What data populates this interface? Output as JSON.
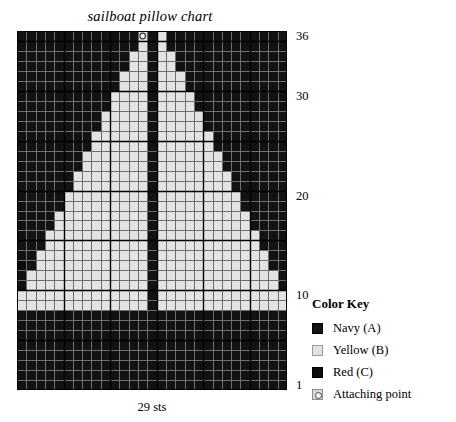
{
  "title": "sailboat pillow chart",
  "caption": "29 sts",
  "legend": {
    "heading": "Color Key",
    "items": [
      {
        "swatch": "navy-swatch",
        "label": "Navy (A)"
      },
      {
        "swatch": "yellow-swatch",
        "label": "Yellow (B)"
      },
      {
        "swatch": "red-swatch",
        "label": "Red (C)"
      },
      {
        "swatch": "attaching-point-swatch",
        "label": "Attaching point"
      }
    ]
  },
  "row_labels": [
    {
      "row": 36,
      "text": "36"
    },
    {
      "row": 30,
      "text": "30"
    },
    {
      "row": 20,
      "text": "20"
    },
    {
      "row": 10,
      "text": "10"
    },
    {
      "row": 1,
      "text": "1"
    }
  ],
  "colors": {
    "navy": "#121212",
    "yellow": "#e3e3e3",
    "red": "#0b0b0b",
    "attaching_point": "#dcdcdc",
    "grid_line": "#6e6e6e",
    "grid_line_major": "#000000",
    "background": "#ffffff",
    "text": "#000000"
  },
  "chart_data": {
    "type": "heatmap",
    "title": "sailboat pillow chart",
    "xlabel": "29 sts",
    "ylabel": "",
    "columns": 29,
    "rows": 36,
    "grid": true,
    "major_gridline_every": 5,
    "row_numbering": "bottom-to-top",
    "legend_position": "right",
    "palette": {
      "A": "navy",
      "B": "yellow",
      "C": "red",
      "P": "attaching point"
    },
    "cells": [
      "AAAAAAAAAAAAAPABAAAAAAAAAAAAA",
      "AAAAAAAAAAAAABABAAAAAAAAAAAAA",
      "AAAAAAAAAAAABBABBAAAAAAAAAAAA",
      "AAAAAAAAAAAABBABBAAAAAAAAAAAA",
      "AAAAAAAAAAABBBABBBAAAAAAAAAAA",
      "AAAAAAAAAAABBBABBBAAAAAAAAAAA",
      "AAAAAAAAAABBBBABBBBAAAAAAAAAA",
      "AAAAAAAAAABBBBABBBBAAAAAAAAAA",
      "AAAAAAAAABBBBBABBBBBAAAAAAAAA",
      "AAAAAAAAABBBBBABBBBBAAAAAAAAA",
      "AAAAAAAABBBBBBABBBBBBAAAAAAAA",
      "AAAAAAAABBBBBBABBBBBBAAAAAAAA",
      "AAAAAAABBBBBBBABBBBBBBAAAAAAA",
      "AAAAAAABBBBBBBABBBBBBBAAAAAAA",
      "AAAAAABBBBBBBBABBBBBBBBAAAAAA",
      "AAAAAABBBBBBBBABBBBBBBBAAAAAA",
      "AAAAABBBBBBBBBABBBBBBBBBAAAAA",
      "AAAAABBBBBBBBBABBBBBBBBBAAAAA",
      "AAAABBBBBBBBBBABBBBBBBBBBAAAA",
      "AAAABBBBBBBBBBABBBBBBBBBBAAAA",
      "AAABBBBBBBBBBBABBBBBBBBBBBAAA",
      "AAABBBBBBBBBBBABBBBBBBBBBBAAA",
      "AABBBBBBBBBBBBABBBBBBBBBBBBAA",
      "CABBBBBBBBBBBBABBBBBBBBBBBBAA",
      "ABBBBBBBBBBBBBABBBBBBBBBBBBBA",
      "ABBBBBBBBBBBBBABBBBBBBBBBBBBA",
      "BBBBBBBBBBBBBBABBBBBBBBBBBBBB",
      "BBBBBBBBBBBBBBABBBBBBBBBBBBBB",
      "AAAAAAAAAAAAAAAAAAAAAAAAAAAAA",
      "AAAAAAAAAAAAAAAAAAAAAAAAAAAAA",
      "AAAAAAAAAAAAAAAAAAAAAAAAAAAAA",
      "AAAAAAAAAAAAAAAAAAAAAAAAAAAAA",
      "AAAAAAAAAAAAAAAAAAAAAAAAAAAAA",
      "AAAAAAAAAAAAAAAAAAAAAAAAAAAAA",
      "AAAAAAAAAAAAAAAAAAAAAAAAAAAAA",
      "AAAAAAAAAAAAAAAAAAAAAAAAAAAAA"
    ]
  }
}
